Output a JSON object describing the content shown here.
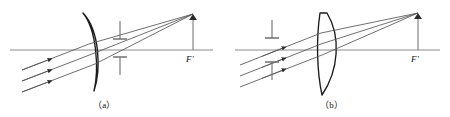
{
  "figure": {
    "type": "optical-ray-diagram-pair",
    "background_color": "#ffffff",
    "ink_color": "#1a1a1a",
    "axis_color": "#808080",
    "ray_color": "#5a5a5a",
    "panels": [
      {
        "id": "a",
        "caption": "（a）",
        "caption_plain": "(a)",
        "focal_label": "F'",
        "lens": {
          "name": "meniscus-lens",
          "shape": "thin-meniscus-convex-right",
          "center_x": 92,
          "top_y": 12,
          "bottom_y": 92
        },
        "stop": {
          "name": "aperture-stop",
          "position": "after-lens",
          "x": 120,
          "upper_bar_top_y": 21,
          "upper_bar_bottom_y": 39,
          "lower_bar_top_y": 57,
          "lower_bar_bottom_y": 75
        },
        "axis": {
          "y": 50,
          "x_start": 10,
          "x_end": 213
        },
        "image_point": {
          "x": 193,
          "y": 14
        },
        "image_arrow": {
          "x": 193,
          "top_y": 14,
          "bottom_y": 50
        },
        "ray_count": 3,
        "ray_arrowheads": 3,
        "incoming_rays_direction": "lower-left to upper-right"
      },
      {
        "id": "b",
        "caption": "（b）",
        "caption_plain": "(b)",
        "focal_label": "F'",
        "lens": {
          "name": "plano-convex-lens",
          "shape": "thick-meniscus-convex-right",
          "center_x": 328,
          "top_y": 12,
          "bottom_y": 95
        },
        "stop": {
          "name": "aperture-stop",
          "position": "before-lens",
          "x": 272,
          "upper_bar_top_y": 20,
          "upper_bar_bottom_y": 38,
          "lower_bar_top_y": 62,
          "lower_bar_bottom_y": 80
        },
        "axis": {
          "y": 50,
          "x_start": 235,
          "x_end": 440
        },
        "image_point": {
          "x": 418,
          "y": 13
        },
        "image_arrow": {
          "x": 418,
          "top_y": 13,
          "bottom_y": 50
        },
        "ray_count": 3,
        "ray_arrowheads": 3,
        "incoming_rays_direction": "lower-left to upper-right"
      }
    ]
  }
}
